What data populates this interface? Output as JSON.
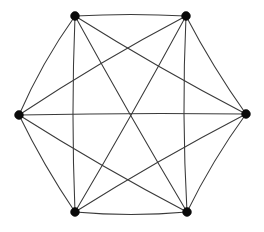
{
  "figure": {
    "background_color": "#ffffff",
    "edge_color": "#3a3a3a",
    "vertex_color": "#0a0a0a",
    "edge_width": 1.05,
    "vertex_radius": 4.4
  },
  "chart_data": {
    "type": "diagram",
    "graph_type": "complete-graph",
    "notation": "K6",
    "vertex_count": 6,
    "edge_count": 15,
    "title": "",
    "xlabel": "",
    "ylabel": "",
    "grid": false,
    "legend": false,
    "vertices": [
      {
        "id": "v1",
        "label": "",
        "position": "top-left",
        "x": 75,
        "y": 16
      },
      {
        "id": "v2",
        "label": "",
        "position": "top-right",
        "x": 186,
        "y": 16
      },
      {
        "id": "v3",
        "label": "",
        "position": "right",
        "x": 246,
        "y": 114
      },
      {
        "id": "v4",
        "label": "",
        "position": "bottom-right",
        "x": 187,
        "y": 212
      },
      {
        "id": "v5",
        "label": "",
        "position": "bottom-left",
        "x": 75,
        "y": 212
      },
      {
        "id": "v6",
        "label": "",
        "position": "left",
        "x": 19,
        "y": 115
      }
    ],
    "edges": [
      {
        "from": "v1",
        "to": "v2",
        "kind": "hexagon-side",
        "bow": -1.5
      },
      {
        "from": "v2",
        "to": "v3",
        "kind": "hexagon-side",
        "bow": 2.0
      },
      {
        "from": "v3",
        "to": "v4",
        "kind": "hexagon-side",
        "bow": 2.5
      },
      {
        "from": "v4",
        "to": "v5",
        "kind": "hexagon-side",
        "bow": -2.5
      },
      {
        "from": "v5",
        "to": "v6",
        "kind": "hexagon-side",
        "bow": -2.0
      },
      {
        "from": "v6",
        "to": "v1",
        "kind": "hexagon-side",
        "bow": -3.0
      },
      {
        "from": "v1",
        "to": "v3",
        "kind": "short-diagonal",
        "bow": 2.0
      },
      {
        "from": "v2",
        "to": "v4",
        "kind": "short-diagonal",
        "bow": 2.5
      },
      {
        "from": "v3",
        "to": "v5",
        "kind": "short-diagonal",
        "bow": 2.0
      },
      {
        "from": "v4",
        "to": "v6",
        "kind": "short-diagonal",
        "bow": -2.0
      },
      {
        "from": "v5",
        "to": "v1",
        "kind": "short-diagonal",
        "bow": -2.0
      },
      {
        "from": "v6",
        "to": "v2",
        "kind": "short-diagonal",
        "bow": -2.5
      },
      {
        "from": "v1",
        "to": "v4",
        "kind": "long-diagonal",
        "bow": 1.0
      },
      {
        "from": "v2",
        "to": "v5",
        "kind": "long-diagonal",
        "bow": -1.0
      },
      {
        "from": "v3",
        "to": "v6",
        "kind": "long-diagonal",
        "bow": 1.0
      }
    ]
  }
}
